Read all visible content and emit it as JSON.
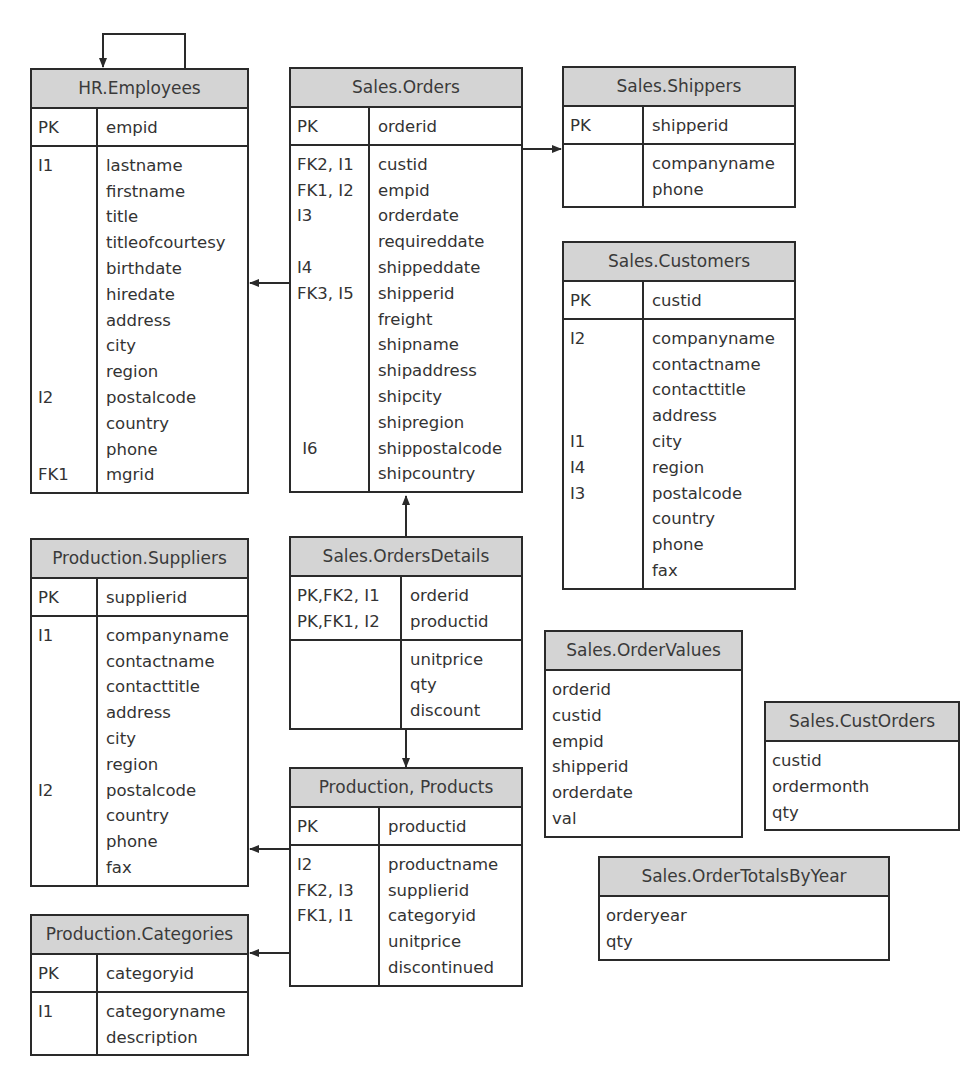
{
  "entities": {
    "employees": {
      "title": "HR.Employees",
      "pk": {
        "keys": [
          "PK"
        ],
        "cols": [
          "empid"
        ]
      },
      "body": {
        "keys": [
          "I1",
          "",
          "",
          "",
          "",
          "",
          "",
          "",
          "",
          "I2",
          "",
          "",
          "FK1"
        ],
        "cols": [
          "lastname",
          "firstname",
          "title",
          "titleofcourtesy",
          "birthdate",
          "hiredate",
          "address",
          "city",
          "region",
          "postalcode",
          "country",
          "phone",
          "mgrid"
        ]
      }
    },
    "orders": {
      "title": "Sales.Orders",
      "pk": {
        "keys": [
          "PK"
        ],
        "cols": [
          "orderid"
        ]
      },
      "body": {
        "keys": [
          "FK2, I1",
          "FK1, I2",
          "I3",
          "",
          "I4",
          "FK3, I5",
          "",
          "",
          "",
          "",
          "",
          " I6",
          ""
        ],
        "cols": [
          "custid",
          "empid",
          "orderdate",
          "requireddate",
          "shippeddate",
          "shipperid",
          "freight",
          "shipname",
          "shipaddress",
          "shipcity",
          "shipregion",
          "shippostalcode",
          "shipcountry"
        ]
      }
    },
    "shippers": {
      "title": "Sales.Shippers",
      "pk": {
        "keys": [
          "PK"
        ],
        "cols": [
          "shipperid"
        ]
      },
      "body": {
        "keys": [
          "",
          ""
        ],
        "cols": [
          "companyname",
          "phone"
        ]
      }
    },
    "customers": {
      "title": "Sales.Customers",
      "pk": {
        "keys": [
          "PK"
        ],
        "cols": [
          "custid"
        ]
      },
      "body": {
        "keys": [
          "I2",
          "",
          "",
          "",
          "I1",
          "I4",
          "I3",
          "",
          "",
          ""
        ],
        "cols": [
          "companyname",
          "contactname",
          "contacttitle",
          "address",
          "city",
          "region",
          "postalcode",
          "country",
          "phone",
          "fax"
        ]
      }
    },
    "suppliers": {
      "title": "Production.Suppliers",
      "pk": {
        "keys": [
          "PK"
        ],
        "cols": [
          "supplierid"
        ]
      },
      "body": {
        "keys": [
          "I1",
          "",
          "",
          "",
          "",
          "",
          "I2",
          "",
          "",
          ""
        ],
        "cols": [
          "companyname",
          "contactname",
          "contacttitle",
          "address",
          "city",
          "region",
          "postalcode",
          "country",
          "phone",
          "fax"
        ]
      }
    },
    "orderdetails": {
      "title": "Sales.OrdersDetails",
      "pk": {
        "keys": [
          "PK,FK2, I1",
          "PK,FK1, I2"
        ],
        "cols": [
          "orderid",
          "productid"
        ]
      },
      "body": {
        "keys": [
          "",
          "",
          ""
        ],
        "cols": [
          "unitprice",
          "qty",
          "discount"
        ]
      }
    },
    "products": {
      "title": "Production, Products",
      "pk": {
        "keys": [
          "PK"
        ],
        "cols": [
          "productid"
        ]
      },
      "body": {
        "keys": [
          "I2",
          "FK2, I3",
          "FK1, I1",
          "",
          ""
        ],
        "cols": [
          "productname",
          "supplierid",
          "categoryid",
          "unitprice",
          "discontinued"
        ]
      }
    },
    "categories": {
      "title": "Production.Categories",
      "pk": {
        "keys": [
          "PK"
        ],
        "cols": [
          "categoryid"
        ]
      },
      "body": {
        "keys": [
          "I1",
          ""
        ],
        "cols": [
          "categoryname",
          "description"
        ]
      }
    },
    "ordervalues": {
      "title": "Sales.OrderValues",
      "cols": [
        "orderid",
        "custid",
        "empid",
        "shipperid",
        "orderdate",
        "val"
      ]
    },
    "custorders": {
      "title": "Sales.CustOrders",
      "cols": [
        "custid",
        "ordermonth",
        "qty"
      ]
    },
    "ordertotals": {
      "title": "Sales.OrderTotalsByYear",
      "cols": [
        "orderyear",
        "qty"
      ]
    }
  },
  "relationships": [
    {
      "from": "HR.Employees.mgrid",
      "to": "HR.Employees.empid"
    },
    {
      "from": "Sales.Orders.empid",
      "to": "HR.Employees.empid"
    },
    {
      "from": "Sales.Orders.custid",
      "to": "Sales.Customers.custid"
    },
    {
      "from": "Sales.Orders.shipperid",
      "to": "Sales.Shippers.shipperid"
    },
    {
      "from": "Sales.OrdersDetails.orderid",
      "to": "Sales.Orders.orderid"
    },
    {
      "from": "Sales.OrdersDetails.productid",
      "to": "Production.Products.productid"
    },
    {
      "from": "Production.Products.supplierid",
      "to": "Production.Suppliers.supplierid"
    },
    {
      "from": "Production.Products.categoryid",
      "to": "Production.Categories.categoryid"
    }
  ],
  "colors": {
    "header_bg": "#d4d4d4",
    "border": "#2a2a2a",
    "text": "#333333"
  }
}
